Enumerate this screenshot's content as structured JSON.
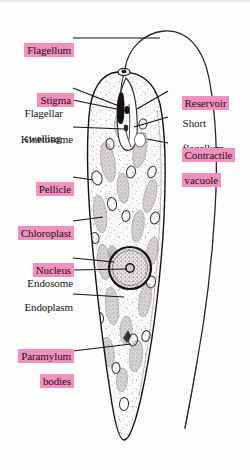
{
  "figure": {
    "highlight_color": "#f48fc0",
    "ink_color": "#1a1216",
    "background_color": "#fdfdfd"
  },
  "labels": [
    {
      "id": "flagellum",
      "text": "Flagellum",
      "highlighted": true,
      "align": "left"
    },
    {
      "id": "stigma",
      "text": "Stigma",
      "highlighted": true,
      "align": "right"
    },
    {
      "id": "flagellar-swelling",
      "line1": "Flagellar",
      "line2": "swelling",
      "text": "Flagellar swelling",
      "highlighted": false,
      "align": "left"
    },
    {
      "id": "kinetosome",
      "text": "Kinetosome",
      "highlighted": false,
      "align": "left"
    },
    {
      "id": "pellicle",
      "text": "Pellicle",
      "highlighted": true,
      "align": "right"
    },
    {
      "id": "chloroplast",
      "text": "Chloroplast",
      "highlighted": true,
      "align": "left"
    },
    {
      "id": "nucleus",
      "text": "Nucleus",
      "highlighted": true,
      "align": "right"
    },
    {
      "id": "endosome",
      "text": "Endosome",
      "highlighted": false,
      "align": "right"
    },
    {
      "id": "endoplasm",
      "text": "Endoplasm",
      "highlighted": false,
      "align": "right"
    },
    {
      "id": "paramylum-bodies",
      "line1": "Paramylum",
      "line2": "bodies",
      "text": "Paramylum bodies",
      "highlighted": true,
      "align": "right"
    },
    {
      "id": "reservoir",
      "text": "Reservoir",
      "highlighted": true,
      "align": "left"
    },
    {
      "id": "short-flagellum",
      "line1": "Short",
      "line2": "flagellum",
      "text": "Short flagellum",
      "highlighted": false,
      "align": "left"
    },
    {
      "id": "contractile-vacuole",
      "line1": "Contractile",
      "line2": "vacuole",
      "text": "Contractile vacuole",
      "highlighted": true,
      "align": "left"
    }
  ]
}
